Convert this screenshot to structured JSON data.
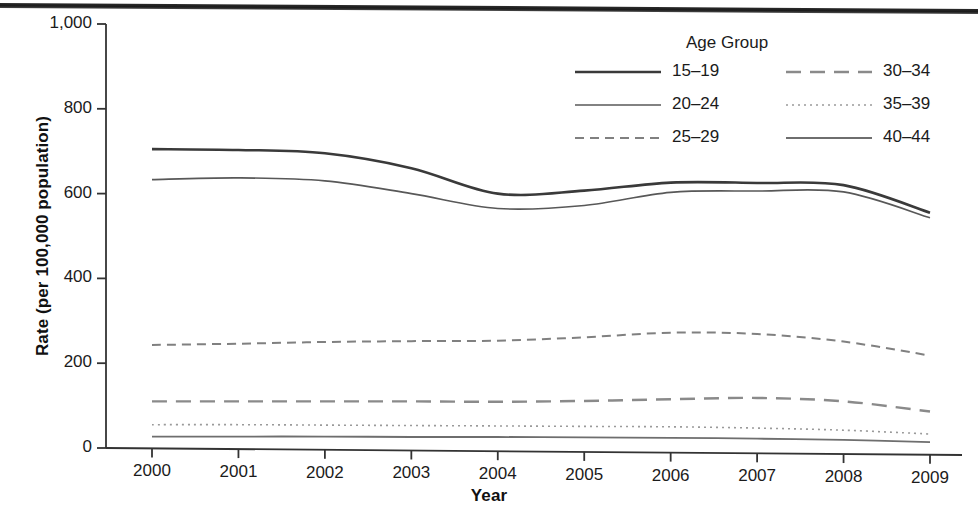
{
  "chart_data": {
    "type": "line",
    "title": "",
    "xlabel": "Year",
    "ylabel": "Rate (per 100,000 population)",
    "x": [
      2000,
      2001,
      2002,
      2003,
      2004,
      2005,
      2006,
      2007,
      2008,
      2009
    ],
    "categories": [
      "2000",
      "2001",
      "2002",
      "2003",
      "2004",
      "2005",
      "2006",
      "2007",
      "2008",
      "2009"
    ],
    "xtick_labels": [
      "2000",
      "2001",
      "2002",
      "2003",
      "2004",
      "2005",
      "2006",
      "2007",
      "2008",
      "2009"
    ],
    "ytick_labels": [
      "0",
      "200",
      "400",
      "600",
      "800",
      "1,000"
    ],
    "ytick_values": [
      0,
      200,
      400,
      600,
      800,
      1000
    ],
    "ylim": [
      0,
      1000
    ],
    "xlim": [
      2000,
      2009
    ],
    "grid": false,
    "legend_position": "top-right",
    "legend_title": "Age Group",
    "series": [
      {
        "name": "15–19",
        "style": "solid-thick",
        "color": "#3a3a3a",
        "values": [
          705,
          703,
          695,
          660,
          600,
          607,
          626,
          625,
          620,
          555
        ]
      },
      {
        "name": "20–24",
        "style": "solid-thin",
        "color": "#585858",
        "values": [
          633,
          637,
          630,
          600,
          565,
          572,
          603,
          606,
          604,
          543
        ]
      },
      {
        "name": "25–29",
        "style": "dashed",
        "color": "#808080",
        "values": [
          243,
          246,
          250,
          252,
          253,
          261,
          272,
          269,
          251,
          218
        ]
      },
      {
        "name": "30–34",
        "style": "long-dash",
        "color": "#8a8a8a",
        "values": [
          110,
          110,
          110,
          110,
          109,
          111,
          115,
          118,
          110,
          86
        ]
      },
      {
        "name": "35–39",
        "style": "dotted",
        "color": "#9a9a9a",
        "values": [
          55,
          55,
          54,
          53,
          52,
          51,
          50,
          47,
          42,
          33
        ]
      },
      {
        "name": "40–44",
        "style": "solid-thin-light",
        "color": "#6e6e6e",
        "values": [
          27,
          27,
          27,
          26,
          26,
          25,
          24,
          22,
          19,
          14
        ]
      }
    ]
  },
  "legend": {
    "title": "Age Group",
    "entries": [
      {
        "label": "15–19",
        "column": 0,
        "row": 0
      },
      {
        "label": "20–24",
        "column": 0,
        "row": 1
      },
      {
        "label": "25–29",
        "column": 0,
        "row": 2
      },
      {
        "label": "30–34",
        "column": 1,
        "row": 0
      },
      {
        "label": "35–39",
        "column": 1,
        "row": 1
      },
      {
        "label": "40–44",
        "column": 1,
        "row": 2
      }
    ]
  },
  "axes": {
    "x_title": "Year",
    "y_title": "Rate (per 100,000 population)"
  }
}
